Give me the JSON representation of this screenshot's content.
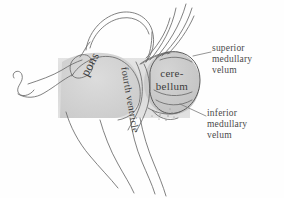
{
  "figure": {
    "style": "pencil anatomical sketch",
    "background_color": "#fefefe",
    "ink_color": "#4a4a4a",
    "band_color": "#dcdcdc",
    "pons_fill": "#d6d6d6",
    "cerebellum_fill": "#cfcfcf"
  },
  "internal_labels": {
    "pons": "pons",
    "fourth_ventricle": "fourth ventricle",
    "cerebellum_line1": "cere-",
    "cerebellum_line2": "bellum"
  },
  "external_labels": [
    {
      "id": "superior-medullary-velum",
      "line1": "superior",
      "line2": "medullary",
      "line3": "velum"
    },
    {
      "id": "inferior-medullary-velum",
      "line1": "inferior",
      "line2": "medullary",
      "line3": "velum"
    }
  ]
}
